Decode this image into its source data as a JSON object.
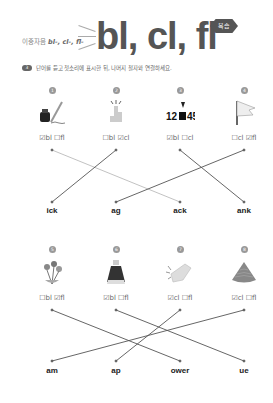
{
  "header": {
    "subtitle_prefix": "이중자음",
    "subtitle_blends": "bl-, cl-, fl-",
    "title": "bl, cl, fl",
    "badge": "복습"
  },
  "exercise": {
    "number": "3",
    "instruction": "단어를 듣고 첫소리에 표시한 뒤, 나머지 철자와 연결하세요."
  },
  "row1": {
    "items": [
      {
        "number": "1",
        "icon": "ink-pen-icon",
        "options": [
          {
            "label": "bl",
            "checked": true
          },
          {
            "label": "fl",
            "checked": false
          }
        ],
        "text": "☑bl ☐fl"
      },
      {
        "number": "2",
        "icon": "clicking-hand-icon",
        "options": [
          {
            "label": "bl",
            "checked": false
          },
          {
            "label": "cl",
            "checked": true
          }
        ],
        "text": "☐bl ☑cl"
      },
      {
        "number": "3",
        "icon": "blank-number-icon",
        "picture_text": "12■45",
        "options": [
          {
            "label": "bl",
            "checked": true
          },
          {
            "label": "cl",
            "checked": false
          }
        ],
        "text": "☑bl ☐cl"
      },
      {
        "number": "4",
        "icon": "flag-icon",
        "options": [
          {
            "label": "cl",
            "checked": false
          },
          {
            "label": "fl",
            "checked": true
          }
        ],
        "text": "☐cl ☑fl"
      }
    ],
    "endings": [
      "ick",
      "ag",
      "ack",
      "ank"
    ]
  },
  "row2": {
    "items": [
      {
        "number": "5",
        "icon": "flower-icon",
        "options": [
          {
            "label": "bl",
            "checked": false
          },
          {
            "label": "fl",
            "checked": true
          }
        ],
        "text": "☐bl ☑fl"
      },
      {
        "number": "6",
        "icon": "blue-paint-icon",
        "options": [
          {
            "label": "bl",
            "checked": true
          },
          {
            "label": "fl",
            "checked": false
          }
        ],
        "text": "☑bl ☐fl"
      },
      {
        "number": "7",
        "icon": "clap-icon",
        "options": [
          {
            "label": "cl",
            "checked": true
          },
          {
            "label": "fl",
            "checked": false
          }
        ],
        "text": "☑cl ☐fl"
      },
      {
        "number": "8",
        "icon": "clam-icon",
        "options": [
          {
            "label": "cl",
            "checked": true
          },
          {
            "label": "fl",
            "checked": false
          }
        ],
        "text": "☑cl ☐fl"
      }
    ],
    "endings": [
      "am",
      "ap",
      "ower",
      "ue"
    ]
  },
  "connections": {
    "row1": [
      {
        "from": 1,
        "to": "ack"
      },
      {
        "from": 2,
        "to": "ick"
      },
      {
        "from": 3,
        "to": "ank"
      },
      {
        "from": 4,
        "to": "ag"
      }
    ],
    "row2": [
      {
        "from": 5,
        "to": "ower"
      },
      {
        "from": 6,
        "to": "ue"
      },
      {
        "from": 7,
        "to": "ap"
      },
      {
        "from": 8,
        "to": "am"
      }
    ]
  },
  "colors": {
    "line": "#555555",
    "line_light": "#bbbbbb",
    "title": "#555555"
  }
}
